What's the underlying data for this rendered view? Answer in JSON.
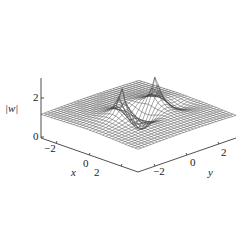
{
  "chart_data": {
    "type": "surface3d",
    "title": "",
    "zlabel": "|w|",
    "xlabel": "x",
    "ylabel": "y",
    "x_ticks": [
      "-2",
      "0",
      "2"
    ],
    "y_ticks": [
      "-2",
      "0",
      "2"
    ],
    "z_ticks": [
      "0",
      "2"
    ],
    "x_range": [
      -3,
      3
    ],
    "y_range": [
      -3,
      3
    ],
    "z_range": [
      0,
      2.8
    ],
    "grid": false,
    "legend": null,
    "baseline_value": 1,
    "features": [
      {
        "type": "peak",
        "x": 0,
        "y": -1,
        "height_clipped": 2.8
      },
      {
        "type": "peak",
        "x": 0,
        "y": 1,
        "height_clipped": 2.8
      },
      {
        "type": "trough",
        "x": 0,
        "y": 0,
        "min": 0
      },
      {
        "type": "depression",
        "description": "valley running along x near the peaks"
      }
    ],
    "style": "wireframe mesh, black lines on white"
  },
  "labels": {
    "z_axis": "|w|",
    "x_axis": "x",
    "y_axis": "y",
    "z_tick_0": "0",
    "z_tick_2": "2",
    "x_tick_m2": "−2",
    "x_tick_0": "0",
    "x_tick_2": "2",
    "y_tick_m2": "−2",
    "y_tick_0": "0",
    "y_tick_2": "2"
  }
}
